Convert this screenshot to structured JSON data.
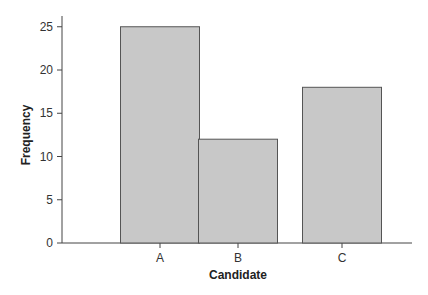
{
  "chart_data": {
    "type": "bar",
    "title": "",
    "xlabel": "Candidate",
    "ylabel": "Frequency",
    "categories": [
      "A",
      "B",
      "C"
    ],
    "values": [
      25,
      12,
      18
    ],
    "ylim": [
      0,
      26
    ],
    "yticks": [
      0,
      5,
      10,
      15,
      20,
      25
    ],
    "grid": false,
    "legend": null,
    "bar_color": "#c8c8c8",
    "bar_edge_color": "#555555"
  }
}
